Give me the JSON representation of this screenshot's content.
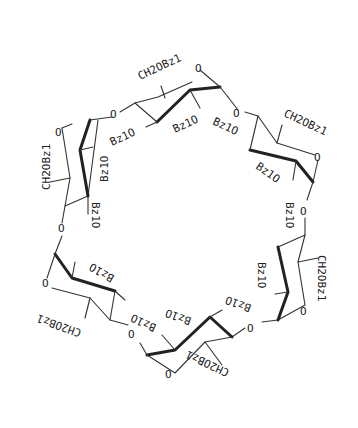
{
  "diagram": {
    "type": "chemical-structure",
    "ring_oxygen": "O",
    "glycosidic_oxygen": "O",
    "units": [
      {
        "position": "top",
        "ch2_label": "CH2OBz1",
        "o2_label": "Bz1O",
        "o3_label": "Bz1O"
      },
      {
        "position": "upper-right",
        "ch2_label": "CH2OBz1",
        "o2_label": "Bz1O",
        "o3_label": "Bz1O"
      },
      {
        "position": "lower-right",
        "ch2_label": "CH2OBz1",
        "o2_label": "Bz1O",
        "o3_label": "Bz1O"
      },
      {
        "position": "bottom",
        "ch2_label": "CH2OBz1",
        "o2_label": "Bz1O",
        "o3_label": "Bz1O"
      },
      {
        "position": "lower-left",
        "ch2_label": "CH2OBz1",
        "o2_label": "Bz1O",
        "o3_label": "Bz1O"
      },
      {
        "position": "upper-left",
        "ch2_label": "CH2OBz1",
        "o2_label": "Bz1O",
        "o3_label": "Bz1O"
      }
    ]
  }
}
